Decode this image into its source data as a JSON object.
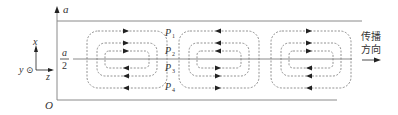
{
  "diagram": {
    "axis_labels": {
      "top": "a",
      "mid_num": "a",
      "mid_den": "2",
      "origin": "O"
    },
    "coord_system": {
      "x": "x",
      "y": "y",
      "z": "z",
      "y_symbol": "⊙"
    },
    "points": [
      {
        "label": "P",
        "sub": "1"
      },
      {
        "label": "P",
        "sub": "2"
      },
      {
        "label": "P",
        "sub": "3"
      },
      {
        "label": "P",
        "sub": "4"
      }
    ],
    "propagation": {
      "line1": "传播",
      "line2": "方向"
    },
    "cells": [
      {
        "center_x": 127
      },
      {
        "center_x": 219
      },
      {
        "center_x": 311
      }
    ],
    "colors": {
      "line": "#8a8a8a",
      "dash": "#777777",
      "arrow": "#222222",
      "text": "#333333"
    }
  }
}
